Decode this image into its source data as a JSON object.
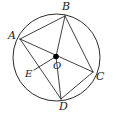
{
  "figure": {
    "stroke_color": "#2b2b2b",
    "fill_color": "#ffffff",
    "point_color": "#000000",
    "background": "#ffffff",
    "labels": {
      "A": "A",
      "B": "B",
      "C": "C",
      "D": "D",
      "E": "E",
      "O": "O"
    }
  },
  "chart_data": {
    "type": "diagram",
    "circle": {
      "center_x": 56.5,
      "center_y": 57.5,
      "radius": 43.5,
      "stroke": "#2b2b2b",
      "stroke_width": 1
    },
    "points": [
      {
        "name": "A",
        "x": 20.0,
        "y": 39.0,
        "marked": false,
        "label_x": 8,
        "label_y": 30
      },
      {
        "name": "B",
        "x": 65.0,
        "y": 16.0,
        "marked": false,
        "label_x": 62,
        "label_y": 1
      },
      {
        "name": "C",
        "x": 93.0,
        "y": 72.0,
        "marked": false,
        "label_x": 96,
        "label_y": 71
      },
      {
        "name": "D",
        "x": 61.0,
        "y": 99.0,
        "marked": false,
        "label_x": 59,
        "label_y": 101
      },
      {
        "name": "O",
        "x": 56.0,
        "y": 56.5,
        "marked": true,
        "label_x": 53,
        "label_y": 61
      },
      {
        "name": "E",
        "x": 34.0,
        "y": 70.0,
        "marked": false,
        "label_x": 25,
        "label_y": 69
      }
    ],
    "segments": [
      {
        "from": "A",
        "to": "B"
      },
      {
        "from": "B",
        "to": "C"
      },
      {
        "from": "A",
        "to": "C"
      },
      {
        "from": "A",
        "to": "D"
      },
      {
        "from": "D",
        "to": "C"
      },
      {
        "from": "B",
        "to": "O"
      },
      {
        "from": "O",
        "to": "D"
      },
      {
        "from": "E",
        "to": "O"
      }
    ]
  }
}
